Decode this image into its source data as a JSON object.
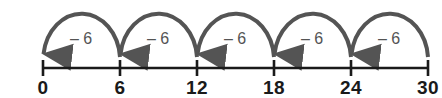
{
  "figure": {
    "kind": "number-line-jumps-diagram",
    "background_color": "#ffffff",
    "width": 442,
    "height": 98
  },
  "number_line": {
    "axis_color": "#1a1a1a",
    "axis_y": 68,
    "axis_start_x": 43,
    "axis_end_x": 428,
    "tick_spacing_px": 77,
    "tick_top_y": 60,
    "tick_bottom_y": 76,
    "label_y": 78,
    "ticks": [
      {
        "label": "0",
        "value": 0,
        "x": 43
      },
      {
        "label": "6",
        "value": 6,
        "x": 120
      },
      {
        "label": "12",
        "value": 12,
        "x": 197
      },
      {
        "label": "18",
        "value": 18,
        "x": 274
      },
      {
        "label": "24",
        "value": 24,
        "x": 351
      },
      {
        "label": "30",
        "value": 30,
        "x": 428
      }
    ]
  },
  "jumps": {
    "arc_color": "#545454",
    "arc_stroke_width": 4,
    "arc_apex_y": 10,
    "label_y": 39,
    "direction": "right-to-left",
    "arrowhead_at": "left-end",
    "items": [
      {
        "label": "– 6",
        "value": -6,
        "from_value": 30,
        "to_value": 24,
        "from_x": 428,
        "to_x": 351,
        "label_x": 389
      },
      {
        "label": "– 6",
        "value": -6,
        "from_value": 24,
        "to_value": 18,
        "from_x": 351,
        "to_x": 274,
        "label_x": 312
      },
      {
        "label": "– 6",
        "value": -6,
        "from_value": 18,
        "to_value": 12,
        "from_x": 274,
        "to_x": 197,
        "label_x": 235
      },
      {
        "label": "– 6",
        "value": -6,
        "from_value": 12,
        "to_value": 6,
        "from_x": 197,
        "to_x": 120,
        "label_x": 158
      },
      {
        "label": "– 6",
        "value": -6,
        "from_value": 6,
        "to_value": 0,
        "from_x": 120,
        "to_x": 43,
        "label_x": 81
      }
    ]
  },
  "chart_data": {
    "type": "line",
    "title": "",
    "xlabel": "",
    "ylabel": "",
    "xlim": [
      0,
      30
    ],
    "grid": false,
    "legend": null,
    "categories": [
      "0",
      "6",
      "12",
      "18",
      "24",
      "30"
    ],
    "values": [
      0,
      6,
      12,
      18,
      24,
      30
    ],
    "annotations": [
      "– 6",
      "– 6",
      "– 6",
      "– 6",
      "– 6"
    ]
  }
}
